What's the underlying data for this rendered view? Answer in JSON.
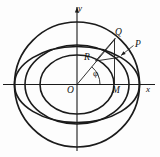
{
  "figure": {
    "kind": "geometric-diagram",
    "background_color": "#fdfdfd",
    "stroke_color": "#1b1b1b",
    "axes": {
      "x_label": "x",
      "y_label": "y",
      "origin_label": "O"
    },
    "labels": {
      "y_axis": "y",
      "x_axis": "x",
      "origin": "O",
      "point_q": "Q",
      "point_p": "P",
      "point_r": "R",
      "point_m": "M",
      "angle": "φ"
    },
    "geometry": {
      "origin": {
        "x": 77,
        "y": 84.5
      },
      "outer_circle": {
        "cx": 77,
        "cy": 84.5,
        "r": 62.5,
        "stroke_width": 1.7
      },
      "wide_ellipse": {
        "cx": 77,
        "cy": 84.5,
        "rx": 62.5,
        "ry": 38.0,
        "stroke_width": 1.7
      },
      "mid_ellipse": {
        "cx": 77,
        "cy": 84.5,
        "rx": 52.0,
        "ry": 39.5,
        "stroke_width": 1.6
      },
      "inner_ellipse": {
        "cx": 77,
        "cy": 84.5,
        "rx": 37.0,
        "ry": 29.5,
        "stroke_width": 1.6
      },
      "x_axis": {
        "x1": 3,
        "y1": 84.5,
        "x2": 155,
        "y2": 84.5
      },
      "y_axis": {
        "x1": 77,
        "y1": 7,
        "x2": 77,
        "y2": 151
      },
      "radius_line": {
        "x1": 77,
        "y1": 84.5,
        "x2": 115.5,
        "y2": 38.5
      },
      "vertical_qm": {
        "x1": 114.5,
        "y1": 38.5,
        "x2": 114.5,
        "y2": 84.5
      },
      "segment_rq": {
        "x1": 95.5,
        "y1": 61.0,
        "x2": 115.0,
        "y2": 38.5
      },
      "segment_rp": {
        "x1": 95.5,
        "y1": 61.0,
        "x2": 118.5,
        "y2": 57.5
      },
      "angle_arc": {
        "cx": 77,
        "cy": 84.5,
        "r": 23.0,
        "start_deg": 0,
        "end_deg": 50
      },
      "point_q": {
        "x": 115.0,
        "y": 38.5
      },
      "point_p": {
        "x": 119.0,
        "y": 55.0
      },
      "point_r": {
        "x": 95.5,
        "y": 61.0
      },
      "point_m": {
        "x": 114.5,
        "y": 84.5
      },
      "p_leader": {
        "x1": 121.0,
        "y1": 55.5,
        "x2": 133.5,
        "y2": 45.5
      }
    },
    "label_positions": {
      "y_axis": {
        "left": 78,
        "top": 4
      },
      "x_axis": {
        "left": 146,
        "top": 85
      },
      "origin": {
        "left": 67,
        "top": 86
      },
      "point_q": {
        "left": 115,
        "top": 28
      },
      "point_p": {
        "left": 135,
        "top": 40
      },
      "point_r": {
        "left": 84,
        "top": 53
      },
      "point_m": {
        "left": 112,
        "top": 86
      },
      "angle": {
        "left": 93,
        "top": 69
      }
    }
  }
}
